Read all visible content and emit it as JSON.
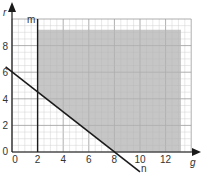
{
  "chart_data": {
    "type": "line",
    "title": "",
    "xlabel": "g",
    "ylabel": "r",
    "xlim": [
      0,
      14
    ],
    "ylim": [
      0,
      10
    ],
    "x_ticks": [
      "0",
      "2",
      "4",
      "6",
      "8",
      "10",
      "12"
    ],
    "y_ticks": [
      "0",
      "2",
      "4",
      "6",
      "8"
    ],
    "grid": true,
    "series": [
      {
        "name": "m",
        "kind": "vertical line",
        "equation": "g = 2",
        "points": [
          [
            2,
            0
          ],
          [
            2,
            10
          ]
        ]
      },
      {
        "name": "n",
        "kind": "line",
        "equation": "3g + 4r = 24",
        "points": [
          [
            -0.5,
            6.4
          ],
          [
            0,
            6
          ],
          [
            8,
            0
          ],
          [
            10,
            -1.5
          ]
        ]
      }
    ],
    "shaded_region": {
      "description": "g >= 2, above line n, r <= 9.2, g <= 13.2",
      "polygon": [
        [
          2,
          9.2
        ],
        [
          13.2,
          9.2
        ],
        [
          13.2,
          0
        ],
        [
          8,
          0
        ],
        [
          2,
          4.5
        ]
      ],
      "color": "#b3b3b3"
    }
  },
  "labels": {
    "x_axis": "g",
    "y_axis": "r",
    "line_m": "m",
    "line_n": "n",
    "origin_x": "0",
    "origin_y": "0"
  },
  "colors": {
    "shade": "#b3b3b3",
    "grid_minor": "#d0d0d0",
    "grid_major": "#9a9a9a",
    "line": "#1a1a1a"
  }
}
